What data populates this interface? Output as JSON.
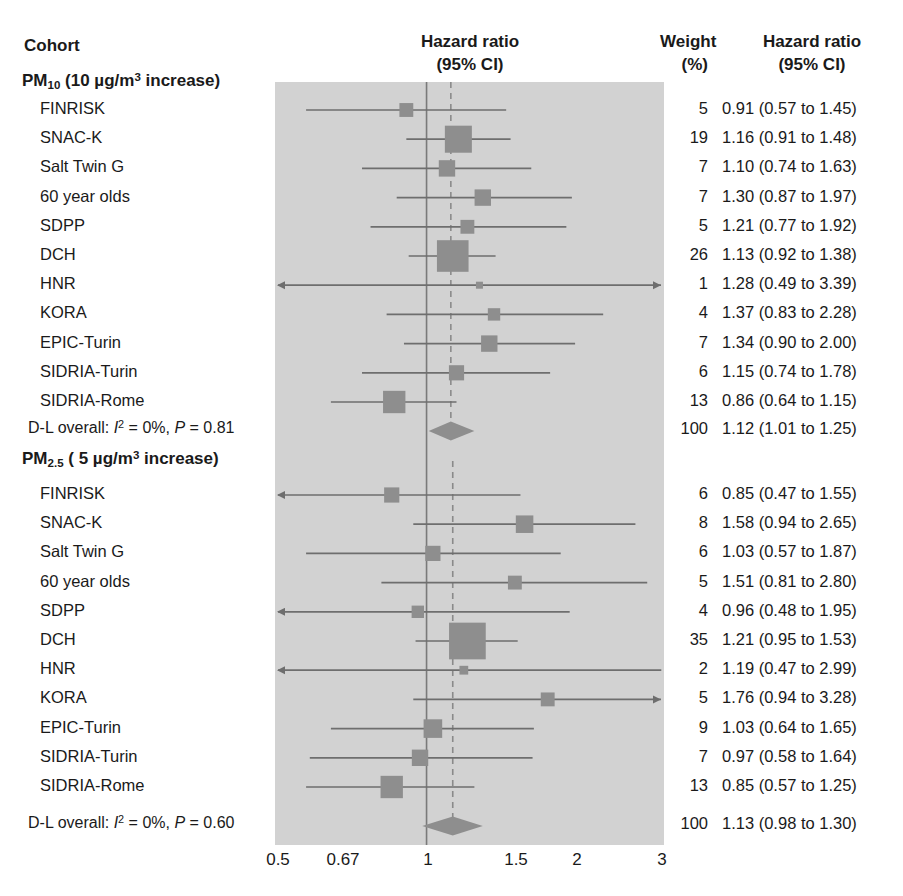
{
  "header": {
    "cohort_label": "Cohort",
    "axis_title_line1": "Hazard ratio",
    "axis_title_line2": "(95% CI)",
    "weight_line1": "Weight",
    "weight_line2": "(%)",
    "hr_line1": "Hazard ratio",
    "hr_line2": "(95% CI)"
  },
  "colors": {
    "plot_background": "#d2d2d2",
    "marker": "#8e8e8e",
    "line": "#6e6e6e",
    "null_line": "#7a7a7a",
    "pooled_line": "#8a8a8a",
    "text": "#1a1a1a"
  },
  "axis": {
    "scale": "log",
    "ticks": [
      0.5,
      0.67,
      1,
      1.5,
      2,
      3
    ],
    "tick_labels": [
      "0.5",
      "0.67",
      "1",
      "1.5",
      "2",
      "3"
    ],
    "xlim": [
      0.45,
      3.3
    ],
    "null_value": 1
  },
  "chart_data": {
    "type": "forest",
    "title": "Hazard ratio (95% CI)",
    "xlabel": "",
    "ylabel": "",
    "xscale": "log",
    "xlim": [
      0.45,
      3.3
    ],
    "xticks": [
      0.5,
      0.67,
      1,
      1.5,
      2,
      3
    ],
    "xtick_labels": [
      "0.5",
      "0.67",
      "1",
      "1.5",
      "2",
      "3"
    ],
    "null_line": 1,
    "grid": false,
    "legend": "none",
    "groups": [
      {
        "name": "PM10",
        "label_html": "PM<sub>10</sub> (10 µg/m<sup>3</sup> increase)",
        "label_text": "PM10 (10 µg/m³ increase)",
        "pooled_value": 1.12,
        "rows": [
          {
            "cohort": "FINRISK",
            "weight": "5",
            "hr": 0.91,
            "lo": 0.57,
            "hi": 1.45,
            "hr_text": "0.91 (0.57 to 1.45)",
            "clip_lo": false,
            "clip_hi": false
          },
          {
            "cohort": "SNAC-K",
            "weight": "19",
            "hr": 1.16,
            "lo": 0.91,
            "hi": 1.48,
            "hr_text": "1.16 (0.91 to 1.48)",
            "clip_lo": false,
            "clip_hi": false
          },
          {
            "cohort": "Salt Twin G",
            "weight": "7",
            "hr": 1.1,
            "lo": 0.74,
            "hi": 1.63,
            "hr_text": "1.10 (0.74 to 1.63)",
            "clip_lo": false,
            "clip_hi": false
          },
          {
            "cohort": "60 year olds",
            "weight": "7",
            "hr": 1.3,
            "lo": 0.87,
            "hi": 1.97,
            "hr_text": "1.30 (0.87 to 1.97)",
            "clip_lo": false,
            "clip_hi": false
          },
          {
            "cohort": "SDPP",
            "weight": "5",
            "hr": 1.21,
            "lo": 0.77,
            "hi": 1.92,
            "hr_text": "1.21 (0.77 to 1.92)",
            "clip_lo": false,
            "clip_hi": false
          },
          {
            "cohort": "DCH",
            "weight": "26",
            "hr": 1.13,
            "lo": 0.92,
            "hi": 1.38,
            "hr_text": "1.13 (0.92 to 1.38)",
            "clip_lo": false,
            "clip_hi": false
          },
          {
            "cohort": "HNR",
            "weight": "1",
            "hr": 1.28,
            "lo": 0.49,
            "hi": 3.39,
            "hr_text": "1.28 (0.49 to 3.39)",
            "clip_lo": true,
            "clip_hi": true
          },
          {
            "cohort": "KORA",
            "weight": "4",
            "hr": 1.37,
            "lo": 0.83,
            "hi": 2.28,
            "hr_text": "1.37 (0.83 to 2.28)",
            "clip_lo": false,
            "clip_hi": false
          },
          {
            "cohort": "EPIC-Turin",
            "weight": "7",
            "hr": 1.34,
            "lo": 0.9,
            "hi": 2.0,
            "hr_text": "1.34 (0.90 to 2.00)",
            "clip_lo": false,
            "clip_hi": false
          },
          {
            "cohort": "SIDRIA-Turin",
            "weight": "6",
            "hr": 1.15,
            "lo": 0.74,
            "hi": 1.78,
            "hr_text": "1.15 (0.74 to 1.78)",
            "clip_lo": false,
            "clip_hi": false
          },
          {
            "cohort": "SIDRIA-Rome",
            "weight": "13",
            "hr": 0.86,
            "lo": 0.64,
            "hi": 1.15,
            "hr_text": "0.86 (0.64 to 1.15)",
            "clip_lo": false,
            "clip_hi": false
          }
        ],
        "summary": {
          "label_text": "D-L overall: I2 = 0%, P = 0.81",
          "i_squared": "0%",
          "p_value": "0.81",
          "weight": "100",
          "hr": 1.12,
          "lo": 1.01,
          "hi": 1.25,
          "hr_text": "1.12 (1.01 to 1.25)"
        }
      },
      {
        "name": "PM2.5",
        "label_html": "PM<sub>2.5</sub> ( 5 µg/m<sup>3</sup> increase)",
        "label_text": "PM2.5 ( 5 µg/m³ increase)",
        "pooled_value": 1.13,
        "rows": [
          {
            "cohort": "FINRISK",
            "weight": "6",
            "hr": 0.85,
            "lo": 0.47,
            "hi": 1.55,
            "hr_text": "0.85 (0.47 to 1.55)",
            "clip_lo": true,
            "clip_hi": false
          },
          {
            "cohort": "SNAC-K",
            "weight": "8",
            "hr": 1.58,
            "lo": 0.94,
            "hi": 2.65,
            "hr_text": "1.58 (0.94 to 2.65)",
            "clip_lo": false,
            "clip_hi": false
          },
          {
            "cohort": "Salt Twin G",
            "weight": "6",
            "hr": 1.03,
            "lo": 0.57,
            "hi": 1.87,
            "hr_text": "1.03 (0.57 to 1.87)",
            "clip_lo": false,
            "clip_hi": false
          },
          {
            "cohort": "60 year olds",
            "weight": "5",
            "hr": 1.51,
            "lo": 0.81,
            "hi": 2.8,
            "hr_text": "1.51 (0.81 to 2.80)",
            "clip_lo": false,
            "clip_hi": false
          },
          {
            "cohort": "SDPP",
            "weight": "4",
            "hr": 0.96,
            "lo": 0.48,
            "hi": 1.95,
            "hr_text": "0.96 (0.48 to 1.95)",
            "clip_lo": true,
            "clip_hi": false
          },
          {
            "cohort": "DCH",
            "weight": "35",
            "hr": 1.21,
            "lo": 0.95,
            "hi": 1.53,
            "hr_text": "1.21 (0.95 to 1.53)",
            "clip_lo": false,
            "clip_hi": false
          },
          {
            "cohort": "HNR",
            "weight": "2",
            "hr": 1.19,
            "lo": 0.47,
            "hi": 2.99,
            "hr_text": "1.19 (0.47 to 2.99)",
            "clip_lo": true,
            "clip_hi": false
          },
          {
            "cohort": "KORA",
            "weight": "5",
            "hr": 1.76,
            "lo": 0.94,
            "hi": 3.28,
            "hr_text": "1.76 (0.94 to 3.28)",
            "clip_lo": false,
            "clip_hi": true
          },
          {
            "cohort": "EPIC-Turin",
            "weight": "9",
            "hr": 1.03,
            "lo": 0.64,
            "hi": 1.65,
            "hr_text": "1.03 (0.64 to 1.65)",
            "clip_lo": false,
            "clip_hi": false
          },
          {
            "cohort": "SIDRIA-Turin",
            "weight": "7",
            "hr": 0.97,
            "lo": 0.58,
            "hi": 1.64,
            "hr_text": "0.97 (0.58 to 1.64)",
            "clip_lo": false,
            "clip_hi": false
          },
          {
            "cohort": "SIDRIA-Rome",
            "weight": "13",
            "hr": 0.85,
            "lo": 0.57,
            "hi": 1.25,
            "hr_text": "0.85 (0.57 to 1.25)",
            "clip_lo": false,
            "clip_hi": false
          }
        ],
        "summary": {
          "label_text": "D-L overall: I2 = 0%, P = 0.60",
          "i_squared": "0%",
          "p_value": "0.60",
          "weight": "100",
          "hr": 1.13,
          "lo": 0.98,
          "hi": 1.3,
          "hr_text": "1.13 (0.98 to 1.30)"
        }
      }
    ]
  }
}
